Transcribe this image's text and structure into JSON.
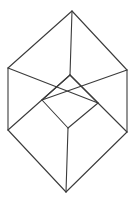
{
  "figure": {
    "kind": "line-drawing",
    "background_color": "#ffffff",
    "line_color": "#3b3b3b",
    "line_width": 1.1,
    "canvas": {
      "width": 137,
      "height": 204
    },
    "vertices": {
      "top_apex": {
        "x": 72,
        "y": 11
      },
      "upper_right": {
        "x": 127,
        "y": 70
      },
      "lower_right": {
        "x": 127,
        "y": 132
      },
      "bottom_apex": {
        "x": 66,
        "y": 192
      },
      "lower_left": {
        "x": 8,
        "y": 130
      },
      "upper_left": {
        "x": 8,
        "y": 68
      },
      "inner_top": {
        "x": 70,
        "y": 75
      },
      "inner_right": {
        "x": 98,
        "y": 103
      },
      "inner_bottom": {
        "x": 68,
        "y": 128
      },
      "inner_left": {
        "x": 42,
        "y": 100
      }
    },
    "edges": [
      {
        "name": "outline-top-left",
        "points": "72,11 8,68"
      },
      {
        "name": "outline-left-vertical",
        "points": "8,68 8,130"
      },
      {
        "name": "outline-bottom-left",
        "points": "8,130 66,192"
      },
      {
        "name": "outline-bottom-right",
        "points": "66,192 127,132"
      },
      {
        "name": "outline-right-vertical",
        "points": "127,132 127,70"
      },
      {
        "name": "outline-top-right",
        "points": "127,70 72,11"
      },
      {
        "name": "spoke-top",
        "points": "72,11 70,75"
      },
      {
        "name": "spoke-bottom",
        "points": "66,192 68,128"
      },
      {
        "name": "diagonal-upper-left",
        "points": "8,68 98,103"
      },
      {
        "name": "diagonal-lower-left",
        "points": "8,130 70,75"
      },
      {
        "name": "diagonal-upper-right",
        "points": "127,70 42,100"
      },
      {
        "name": "diagonal-lower-right",
        "points": "127,132 70,75"
      },
      {
        "name": "inner-top-left",
        "points": "42,100 70,75"
      },
      {
        "name": "inner-top-right",
        "points": "70,75 98,103"
      },
      {
        "name": "inner-bottom-right",
        "points": "98,103 68,128"
      },
      {
        "name": "inner-bottom-left",
        "points": "68,128 42,100"
      }
    ]
  }
}
